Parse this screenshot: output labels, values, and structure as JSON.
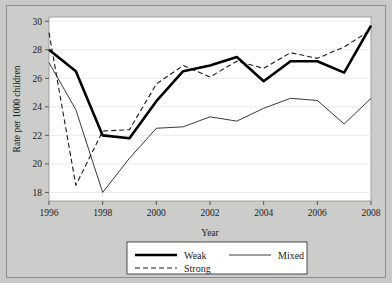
{
  "chart_data": {
    "type": "line",
    "title": "",
    "xlabel": "Year",
    "ylabel": "Rate per 1000 children",
    "x": [
      1996,
      1997,
      1998,
      1999,
      2000,
      2001,
      2002,
      2003,
      2004,
      2005,
      2006,
      2007,
      2008
    ],
    "xlim": [
      1996,
      2008
    ],
    "ylim": [
      17.4,
      30.3
    ],
    "xticks": [
      1996,
      1998,
      2000,
      2002,
      2004,
      2006,
      2008
    ],
    "xticklabels": [
      "1996",
      "1998",
      "2000",
      "2002",
      "2004",
      "2006",
      "2008"
    ],
    "yticks": [
      18,
      20,
      22,
      24,
      26,
      28,
      30
    ],
    "yticklabels": [
      "18",
      "20",
      "22",
      "24",
      "26",
      "28",
      "30"
    ],
    "grid": "horizontal",
    "legend_position": "below-axes",
    "series": [
      {
        "name": "Weak",
        "style": "thick-solid",
        "color": "#000000",
        "width": 2.6,
        "values": [
          28.0,
          26.5,
          22.0,
          21.8,
          24.4,
          26.5,
          26.9,
          27.5,
          25.8,
          27.2,
          27.2,
          26.4,
          29.7
        ]
      },
      {
        "name": "Strong",
        "style": "dashed",
        "color": "#1a1a1a",
        "width": 1.1,
        "values": [
          29.2,
          18.5,
          22.3,
          22.4,
          25.6,
          26.9,
          26.1,
          27.2,
          26.7,
          27.8,
          27.4,
          28.2,
          29.4
        ]
      },
      {
        "name": "Mixed",
        "style": "thin-solid",
        "color": "#3a3a3a",
        "width": 1.0,
        "values": [
          27.1,
          23.8,
          18.0,
          20.4,
          22.5,
          22.6,
          23.3,
          23.0,
          23.9,
          24.6,
          24.45,
          22.8,
          24.6
        ]
      }
    ]
  },
  "legend": {
    "items": [
      {
        "label": "Weak",
        "swatch": "thick-solid"
      },
      {
        "label": "Mixed",
        "swatch": "thin-solid"
      },
      {
        "label": "Strong",
        "swatch": "dashed"
      }
    ]
  },
  "axes": {
    "x_title": "Year",
    "y_title": "Rate per 1000 children"
  },
  "colors": {
    "figure_background": "#c9c9c7",
    "plot_background": "#ffffff",
    "frame": "#8d8d8b",
    "grid": "#e9e9e9",
    "text": "#1a1a1a"
  }
}
